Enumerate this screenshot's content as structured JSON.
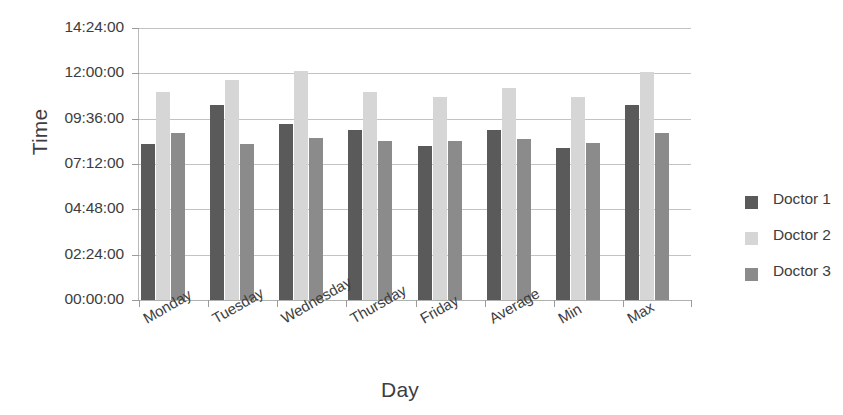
{
  "chart_data": {
    "type": "bar",
    "title": "",
    "xlabel": "Day",
    "ylabel": "Time",
    "grid": true,
    "legend_position": "right",
    "categories": [
      "Monday",
      "Tuesday",
      "Wednesday",
      "Thursday",
      "Friday",
      "Average",
      "Min",
      "Max"
    ],
    "ylim": [
      "00:00:00",
      "14:24:00"
    ],
    "ytick_labels": [
      "14:24:00",
      "12:00:00",
      "09:36:00",
      "07:12:00",
      "04:48:00",
      "02:24:00",
      "00:00:00"
    ],
    "ytick_values": [
      14.4,
      12.0,
      9.6,
      7.2,
      4.8,
      2.4,
      0.0
    ],
    "series": [
      {
        "name": "Doctor 1",
        "color": "#5a5a5a",
        "values": [
          8.25,
          10.33,
          9.33,
          9.0,
          8.15,
          9.0,
          8.05,
          10.33
        ],
        "value_labels": [
          "08:15:00",
          "10:20:00",
          "09:20:00",
          "09:00:00",
          "08:09:00",
          "09:00:00",
          "08:03:00",
          "10:20:00"
        ]
      },
      {
        "name": "Doctor 2",
        "color": "#d6d6d6",
        "values": [
          11.0,
          11.65,
          12.1,
          11.0,
          10.75,
          11.25,
          10.75,
          12.05
        ],
        "value_labels": [
          "11:00:00",
          "11:39:00",
          "12:06:00",
          "11:00:00",
          "10:45:00",
          "11:15:00",
          "10:45:00",
          "12:03:00"
        ]
      },
      {
        "name": "Doctor 3",
        "color": "#8b8b8b",
        "values": [
          8.85,
          8.25,
          8.6,
          8.4,
          8.4,
          8.5,
          8.3,
          8.83
        ],
        "value_labels": [
          "08:51:00",
          "08:15:00",
          "08:36:00",
          "08:24:00",
          "08:24:00",
          "08:30:00",
          "08:18:00",
          "08:50:00"
        ]
      }
    ]
  },
  "axes": {
    "y_title": "Time",
    "x_title": "Day"
  },
  "legend": {
    "items": [
      {
        "label": "Doctor 1",
        "color": "#5a5a5a"
      },
      {
        "label": "Doctor 2",
        "color": "#d6d6d6"
      },
      {
        "label": "Doctor 3",
        "color": "#8b8b8b"
      }
    ]
  }
}
